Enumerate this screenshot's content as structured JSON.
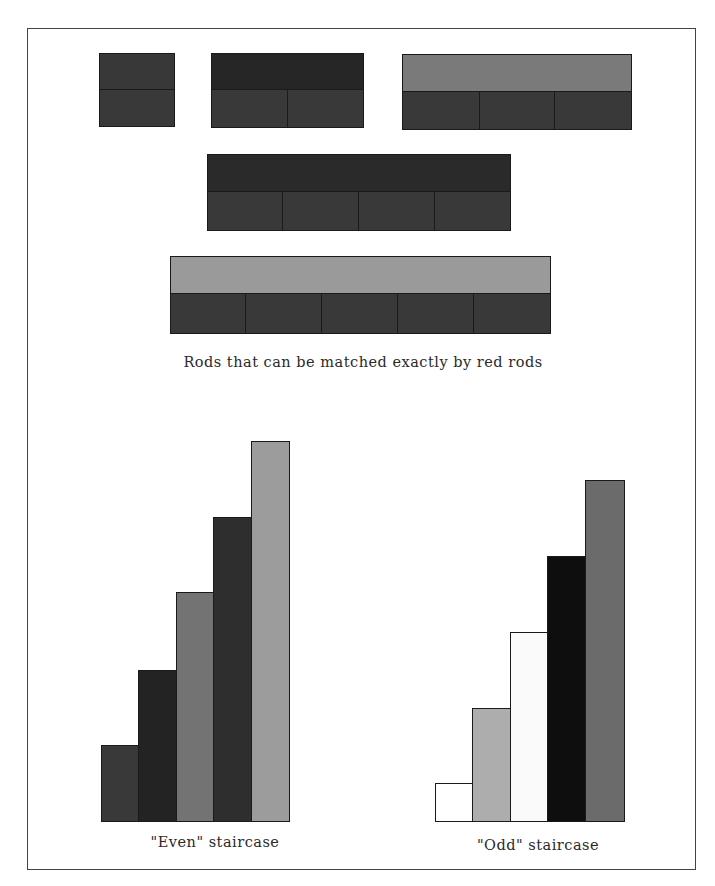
{
  "colors": {
    "red": "#3a3a3a",
    "purple": "#2c2c2c",
    "light_green": "#8f8f8f",
    "dark_green": "#6f6f6f",
    "brown": "#2b2b2b",
    "orange": "#a3a3a3",
    "white": "#ffffff",
    "black": "#0f0f0f",
    "blue": "#6a6a6a",
    "yellow": "#b0b0b0",
    "border": "#1a1a1a"
  },
  "matching": {
    "caption": "Rods that can be matched exactly by red rods",
    "groups": [
      {
        "name": "red-rod-2",
        "length_units": 2,
        "top_color": "#383838",
        "red_rods": 1
      },
      {
        "name": "purple-rod-4",
        "length_units": 4,
        "top_color": "#262626",
        "red_rods": 2
      },
      {
        "name": "dark-green-rod-6",
        "length_units": 6,
        "top_color": "#7a7a7a",
        "red_rods": 3
      },
      {
        "name": "brown-rod-8",
        "length_units": 8,
        "top_color": "#2a2a2a",
        "red_rods": 4
      },
      {
        "name": "orange-rod-10",
        "length_units": 10,
        "top_color": "#9a9a9a",
        "red_rods": 5
      }
    ]
  },
  "even_staircase": {
    "caption": "\"Even\" staircase",
    "rods": [
      {
        "name": "red",
        "length_units": 2,
        "color": "#393939"
      },
      {
        "name": "purple",
        "length_units": 4,
        "color": "#232323"
      },
      {
        "name": "dark-green",
        "length_units": 6,
        "color": "#737373"
      },
      {
        "name": "brown",
        "length_units": 8,
        "color": "#2e2e2e"
      },
      {
        "name": "orange",
        "length_units": 10,
        "color": "#9c9c9c"
      }
    ]
  },
  "odd_staircase": {
    "caption": "\"Odd\" staircase",
    "rods": [
      {
        "name": "white",
        "length_units": 1,
        "color": "#ffffff"
      },
      {
        "name": "light-green",
        "length_units": 3,
        "color": "#adadad"
      },
      {
        "name": "yellow",
        "length_units": 5,
        "color": "#fafafa"
      },
      {
        "name": "black",
        "length_units": 7,
        "color": "#0e0e0e"
      },
      {
        "name": "blue",
        "length_units": 9,
        "color": "#6b6b6b"
      }
    ]
  }
}
